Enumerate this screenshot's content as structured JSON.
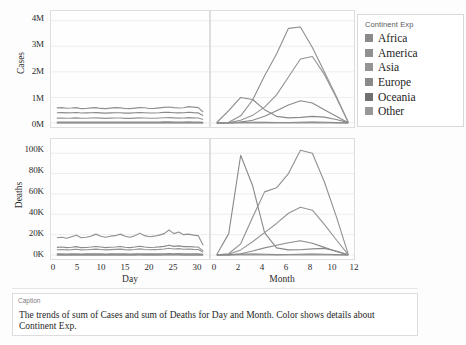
{
  "legend": {
    "title": "Continent Exp",
    "items": [
      {
        "label": "Africa",
        "color": "#8a8a8a"
      },
      {
        "label": "America",
        "color": "#909090"
      },
      {
        "label": "Asia",
        "color": "#949494"
      },
      {
        "label": "Europe",
        "color": "#898989"
      },
      {
        "label": "Oceania",
        "color": "#707070"
      },
      {
        "label": "Other",
        "color": "#979797"
      }
    ]
  },
  "caption": {
    "tag": "Caption",
    "text": "The trends of sum of Cases and sum of Deaths for Day and Month.  Color shows details about Continent Exp."
  },
  "chart_data": {
    "type": "line",
    "title": "",
    "subtitle": "",
    "grid": true,
    "legend_position": "right",
    "color_field": "Continent Exp",
    "series_names": [
      "Africa",
      "America",
      "Asia",
      "Europe",
      "Oceania",
      "Other"
    ],
    "panels": [
      {
        "id": "cases-by-day",
        "ylabel": "Cases",
        "xlabel": "Day",
        "yticks": [
          "0M",
          "1M",
          "2M",
          "3M",
          "4M"
        ],
        "ytick_values": [
          0,
          1000000,
          2000000,
          3000000,
          4000000
        ],
        "ylim": [
          0,
          4300000
        ],
        "xticks": [
          "0",
          "5",
          "10",
          "15",
          "20",
          "25",
          "30"
        ],
        "xtick_values": [
          0,
          5,
          10,
          15,
          20,
          25,
          30
        ],
        "xlim": [
          0,
          32
        ],
        "x": [
          1,
          2,
          3,
          4,
          5,
          6,
          7,
          8,
          9,
          10,
          11,
          12,
          13,
          14,
          15,
          16,
          17,
          18,
          19,
          20,
          21,
          22,
          23,
          24,
          25,
          26,
          27,
          28,
          29,
          30,
          31
        ],
        "series": [
          {
            "name": "America",
            "values": [
              590000,
              600000,
              575000,
              585000,
              600000,
              560000,
              565000,
              590000,
              600000,
              570000,
              560000,
              580000,
              600000,
              590000,
              565000,
              560000,
              580000,
              600000,
              595000,
              565000,
              570000,
              590000,
              610000,
              625000,
              600000,
              585000,
              595000,
              640000,
              620000,
              600000,
              430000
            ]
          },
          {
            "name": "Europe",
            "values": [
              400000,
              405000,
              395000,
              400000,
              410000,
              390000,
              395000,
              400000,
              405000,
              395000,
              385000,
              395000,
              400000,
              400000,
              385000,
              385000,
              400000,
              405000,
              400000,
              390000,
              390000,
              400000,
              415000,
              420000,
              400000,
              395000,
              400000,
              420000,
              405000,
              395000,
              290000
            ]
          },
          {
            "name": "Asia",
            "values": [
              190000,
              195000,
              185000,
              190000,
              200000,
              185000,
              188000,
              195000,
              200000,
              190000,
              182000,
              190000,
              198000,
              195000,
              182000,
              180000,
              192000,
              200000,
              196000,
              186000,
              188000,
              196000,
              205000,
              210000,
              200000,
              192000,
              196000,
              212000,
              202000,
              193000,
              140000
            ]
          },
          {
            "name": "Africa",
            "values": [
              40000,
              41000,
              39000,
              40000,
              42000,
              38000,
              39000,
              41000,
              42000,
              40000,
              38000,
              40000,
              42000,
              41000,
              38000,
              38000,
              40000,
              42000,
              41000,
              39000,
              39000,
              41000,
              43000,
              44000,
              42000,
              40000,
              41000,
              44000,
              42000,
              40000,
              29000
            ]
          },
          {
            "name": "Oceania",
            "values": [
              9000,
              9200,
              8800,
              9000,
              9400,
              8600,
              8800,
              9200,
              9400,
              9000,
              8600,
              9000,
              9400,
              9200,
              8600,
              8500,
              9000,
              9400,
              9200,
              8800,
              8800,
              9200,
              9600,
              9900,
              9400,
              9000,
              9200,
              9900,
              9400,
              9000,
              6500
            ]
          },
          {
            "name": "Other",
            "values": [
              500,
              500,
              500,
              500,
              500,
              500,
              500,
              500,
              500,
              500,
              500,
              500,
              500,
              500,
              500,
              500,
              500,
              500,
              500,
              500,
              500,
              500,
              500,
              500,
              500,
              500,
              500,
              500,
              500,
              500,
              400
            ]
          }
        ]
      },
      {
        "id": "cases-by-month",
        "ylabel": "Cases",
        "xlabel": "Month",
        "yticks": [
          "0M",
          "1M",
          "2M",
          "3M",
          "4M"
        ],
        "ytick_values": [
          0,
          1000000,
          2000000,
          3000000,
          4000000
        ],
        "ylim": [
          0,
          4300000
        ],
        "xticks": [
          "0",
          "2",
          "4",
          "6",
          "8",
          "10",
          "12"
        ],
        "xtick_values": [
          0,
          2,
          4,
          6,
          8,
          10,
          12
        ],
        "xlim": [
          0.6,
          12.4
        ],
        "x": [
          1,
          2,
          3,
          4,
          5,
          6,
          7,
          8,
          9,
          10,
          11,
          12
        ],
        "series": [
          {
            "name": "America",
            "values": [
              5000,
              30000,
              280000,
              900000,
              1850000,
              2700000,
              3700000,
              3750000,
              2950000,
              2000000,
              1050000,
              30000
            ]
          },
          {
            "name": "Asia",
            "values": [
              3000,
              20000,
              110000,
              300000,
              620000,
              1100000,
              1800000,
              2500000,
              2600000,
              1900000,
              1000000,
              25000
            ]
          },
          {
            "name": "Europe",
            "values": [
              20000,
              480000,
              1000000,
              920000,
              520000,
              260000,
              200000,
              220000,
              260000,
              230000,
              140000,
              15000
            ]
          },
          {
            "name": "Africa",
            "values": [
              1000,
              6000,
              40000,
              110000,
              260000,
              480000,
              700000,
              870000,
              780000,
              520000,
              260000,
              8000
            ]
          },
          {
            "name": "Oceania",
            "values": [
              1000,
              5000,
              25000,
              30000,
              25000,
              18000,
              20000,
              30000,
              40000,
              30000,
              15000,
              2000
            ]
          },
          {
            "name": "Other",
            "values": [
              300,
              3000,
              6000,
              6500,
              6500,
              6500,
              6500,
              6500,
              6500,
              6500,
              6500,
              500
            ]
          }
        ]
      },
      {
        "id": "deaths-by-day",
        "ylabel": "Deaths",
        "xlabel": "Day",
        "yticks": [
          "0K",
          "20K",
          "40K",
          "60K",
          "80K",
          "100K"
        ],
        "ytick_values": [
          0,
          20000,
          40000,
          60000,
          80000,
          100000
        ],
        "ylim": [
          0,
          112000
        ],
        "xticks": [
          "0",
          "5",
          "10",
          "15",
          "20",
          "25",
          "30"
        ],
        "xtick_values": [
          0,
          5,
          10,
          15,
          20,
          25,
          30
        ],
        "xlim": [
          0,
          32
        ],
        "x": [
          1,
          2,
          3,
          4,
          5,
          6,
          7,
          8,
          9,
          10,
          11,
          12,
          13,
          14,
          15,
          16,
          17,
          18,
          19,
          20,
          21,
          22,
          23,
          24,
          25,
          26,
          27,
          28,
          29,
          30,
          31
        ],
        "series": [
          {
            "name": "America",
            "values": [
              17000,
              17500,
              16500,
              18000,
              19500,
              17000,
              17500,
              18500,
              20500,
              18500,
              17500,
              18500,
              19000,
              20500,
              18500,
              17500,
              19000,
              21500,
              19000,
              18000,
              18500,
              19500,
              21000,
              24500,
              21000,
              22500,
              20000,
              20500,
              19500,
              19000,
              9500
            ]
          },
          {
            "name": "Europe",
            "values": [
              7500,
              7800,
              7200,
              7600,
              8200,
              7200,
              7400,
              7800,
              8400,
              7800,
              7200,
              7600,
              7900,
              8300,
              7600,
              7200,
              7800,
              8600,
              7800,
              7400,
              7600,
              8000,
              8500,
              9600,
              8500,
              9000,
              8200,
              8400,
              8000,
              7800,
              4000
            ]
          },
          {
            "name": "Asia",
            "values": [
              5200,
              5400,
              5000,
              5300,
              5700,
              5000,
              5100,
              5400,
              5800,
              5400,
              5000,
              5300,
              5500,
              5800,
              5300,
              5000,
              5400,
              6000,
              5400,
              5100,
              5300,
              5500,
              5900,
              6700,
              5900,
              6300,
              5700,
              5800,
              5500,
              5400,
              2800
            ]
          },
          {
            "name": "Africa",
            "values": [
              1100,
              1150,
              1050,
              1120,
              1200,
              1050,
              1080,
              1140,
              1220,
              1140,
              1050,
              1120,
              1160,
              1220,
              1120,
              1050,
              1140,
              1260,
              1140,
              1080,
              1120,
              1160,
              1240,
              1400,
              1240,
              1320,
              1200,
              1220,
              1160,
              1140,
              600
            ]
          },
          {
            "name": "Oceania",
            "values": [
              150,
              160,
              145,
              155,
              165,
              145,
              150,
              158,
              168,
              158,
              145,
              155,
              160,
              168,
              155,
              145,
              158,
              175,
              158,
              150,
              155,
              160,
              172,
              195,
              172,
              183,
              166,
              169,
              160,
              158,
              85
            ]
          },
          {
            "name": "Other",
            "values": [
              10,
              10,
              10,
              10,
              10,
              10,
              10,
              10,
              10,
              10,
              10,
              10,
              10,
              10,
              10,
              10,
              10,
              10,
              10,
              10,
              10,
              10,
              10,
              10,
              10,
              10,
              10,
              10,
              10,
              10,
              5
            ]
          }
        ]
      },
      {
        "id": "deaths-by-month",
        "ylabel": "Deaths",
        "xlabel": "Month",
        "yticks": [
          "0K",
          "20K",
          "40K",
          "60K",
          "80K",
          "100K"
        ],
        "ytick_values": [
          0,
          20000,
          40000,
          60000,
          80000,
          100000
        ],
        "ylim": [
          0,
          112000
        ],
        "xticks": [
          "0",
          "2",
          "4",
          "6",
          "8",
          "10",
          "12"
        ],
        "xtick_values": [
          0,
          2,
          4,
          6,
          8,
          10,
          12
        ],
        "xlim": [
          0.6,
          12.4
        ],
        "x": [
          1,
          2,
          3,
          4,
          5,
          6,
          7,
          8,
          9,
          10,
          11,
          12
        ],
        "series": [
          {
            "name": "America",
            "values": [
              200,
              1200,
              11000,
              37000,
              62000,
              66000,
              80000,
              103000,
              100000,
              72000,
              38000,
              900
            ]
          },
          {
            "name": "Europe",
            "values": [
              500,
              21000,
              98000,
              68000,
              22000,
              7000,
              5000,
              5200,
              6000,
              6500,
              4000,
              300
            ]
          },
          {
            "name": "Asia",
            "values": [
              150,
              800,
              5000,
              13000,
              22000,
              31000,
              41000,
              47000,
              44000,
              30000,
              15000,
              400
            ]
          },
          {
            "name": "Africa",
            "values": [
              30,
              200,
              1300,
              4000,
              7000,
              9500,
              12000,
              14000,
              11500,
              7500,
              3500,
              120
            ]
          },
          {
            "name": "Oceania",
            "values": [
              20,
              120,
              700,
              900,
              700,
              400,
              450,
              700,
              1000,
              700,
              350,
              40
            ]
          },
          {
            "name": "Other",
            "values": [
              5,
              60,
              110,
              120,
              120,
              120,
              120,
              120,
              120,
              120,
              120,
              10
            ]
          }
        ]
      }
    ]
  }
}
